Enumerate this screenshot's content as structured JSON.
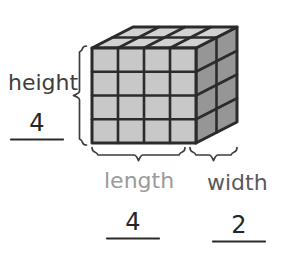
{
  "figure": {
    "type": "rectangular-prism-volume-diagram",
    "background_color": "#ffffff",
    "solid": {
      "name": "rectangular prism made of unit cubes",
      "units_length": 4,
      "units_width": 2,
      "units_height": 4,
      "total_unit_cubes": 32,
      "projection": "oblique",
      "faces": {
        "front": {
          "columns": 4,
          "rows": 4,
          "fill": "#c8c8c8"
        },
        "top": {
          "columns": 4,
          "rows": 2,
          "fill": "#d2d2d2"
        },
        "right": {
          "columns": 2,
          "rows": 4,
          "fill": "#969696"
        }
      },
      "edge_color": "#2b2b2b",
      "geometry": {
        "front_left_x": 92,
        "front_right_x": 196,
        "front_top_y": 48,
        "front_bottom_y": 143,
        "depth_dx": 41,
        "depth_dy": -21
      }
    },
    "dimensions": [
      {
        "id": "height",
        "label": "height",
        "label_color": "#3d3d3d",
        "value": "4",
        "brace": "vertical-left"
      },
      {
        "id": "length",
        "label": "length",
        "label_color": "#9a9a9a",
        "value": "4",
        "brace": "horizontal-bottom-left"
      },
      {
        "id": "width",
        "label": "width",
        "label_color": "#5a5a5a",
        "value": "2",
        "brace": "horizontal-bottom-right"
      }
    ],
    "answer_blanks": {
      "line_color": "#2b2b2b",
      "digit_color": "#262626"
    }
  }
}
